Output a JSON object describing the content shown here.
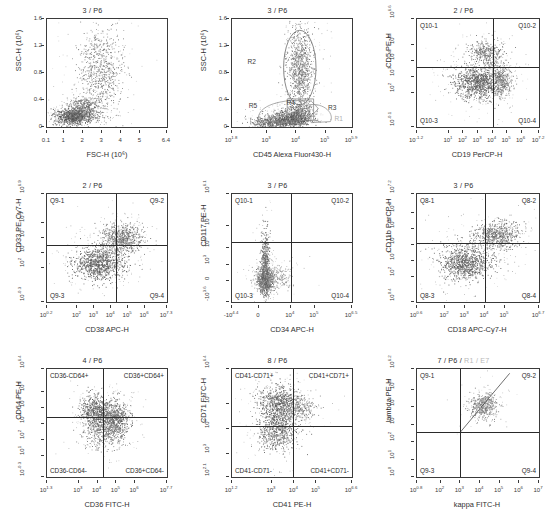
{
  "figure": {
    "kind": "flow-cytometry-panel-grid",
    "rows": 3,
    "cols": 3
  },
  "chart_data": [
    {
      "id": "p1",
      "type": "scatter",
      "title": "3 / P6",
      "xlabel": "FSC-H (10⁶)",
      "ylabel": "SSC-H (10⁶)",
      "xscale": "linear",
      "yscale": "linear",
      "xlim": [
        0.1,
        6.4
      ],
      "ylim": [
        0,
        1.6
      ],
      "xticks": [
        "0.1",
        "1",
        "2",
        "3",
        "4",
        "5",
        "6.4"
      ],
      "xtick_pos": [
        0.0,
        0.143,
        0.302,
        0.46,
        0.619,
        0.778,
        1.0
      ],
      "yticks": [
        "0",
        "0.4",
        "0.8",
        "1.2",
        "1.6"
      ],
      "ytick_pos": [
        0.0,
        0.25,
        0.5,
        0.75,
        1.0
      ],
      "grid": false,
      "quadrants": null,
      "gates": [],
      "clusters": [
        {
          "name": "lymphocytes",
          "cx": 0.22,
          "cy": 0.1,
          "sx": 0.075,
          "sy": 0.035,
          "n": 900,
          "shade": 0.16
        },
        {
          "name": "monocytes",
          "cx": 0.31,
          "cy": 0.18,
          "sx": 0.075,
          "sy": 0.045,
          "n": 380,
          "shade": 0.3
        },
        {
          "name": "granulocytes",
          "cx": 0.44,
          "cy": 0.52,
          "sx": 0.09,
          "sy": 0.2,
          "n": 700,
          "shade": 0.42
        }
      ]
    },
    {
      "id": "p2",
      "type": "scatter",
      "title": "3 / P6",
      "xlabel": "CD45 Alexa Fluor430-H",
      "ylabel": "SSC-H (10⁶)",
      "xscale": "log",
      "yscale": "linear",
      "xlim": [
        "10^1.8",
        "10^5.9"
      ],
      "ylim": [
        0,
        1.6
      ],
      "xticks": [
        "10^1.8",
        "10^3",
        "10^4",
        "10^5",
        "10^5.9"
      ],
      "xtick_pos": [
        0.0,
        0.293,
        0.537,
        0.78,
        1.0
      ],
      "yticks": [
        "0",
        "0.4",
        "0.8",
        "1.2",
        "1.6"
      ],
      "ytick_pos": [
        0.0,
        0.25,
        0.5,
        0.75,
        1.0
      ],
      "grid": false,
      "quadrants": null,
      "gates": [
        {
          "name": "R2",
          "label_x": 0.13,
          "label_y": 0.6,
          "shape": "ellipse",
          "cx": 0.565,
          "cy": 0.55,
          "rx": 0.135,
          "ry": 0.345,
          "faint": false
        },
        {
          "name": "R5",
          "label_x": 0.14,
          "label_y": 0.195,
          "shape": "polygon",
          "faint": false
        },
        {
          "name": "R4",
          "label_x": 0.455,
          "label_y": 0.225,
          "shape": "polygon",
          "faint": false
        },
        {
          "name": "R3",
          "label_x": 0.8,
          "label_y": 0.18,
          "shape": "polygon",
          "faint": false
        },
        {
          "name": "R1",
          "label_x": 0.855,
          "label_y": 0.075,
          "shape": "polygon",
          "faint": true
        }
      ],
      "clusters": [
        {
          "name": "granulocytes",
          "cx": 0.565,
          "cy": 0.56,
          "sx": 0.055,
          "sy": 0.19,
          "n": 820,
          "shade": 0.36
        },
        {
          "name": "monocytes",
          "cx": 0.555,
          "cy": 0.135,
          "sx": 0.06,
          "sy": 0.045,
          "n": 300,
          "shade": 0.3
        },
        {
          "name": "lymphocytes",
          "cx": 0.47,
          "cy": 0.07,
          "sx": 0.085,
          "sy": 0.035,
          "n": 780,
          "shade": 0.18
        },
        {
          "name": "debris",
          "cx": 0.3,
          "cy": 0.045,
          "sx": 0.07,
          "sy": 0.03,
          "n": 280,
          "shade": 0.26
        }
      ]
    },
    {
      "id": "p3",
      "type": "scatter",
      "title": "2 / P6",
      "xlabel": "CD19 PerCP-H",
      "ylabel": "CD5 PE-H",
      "xscale": "log",
      "yscale": "log",
      "xlim": [
        "10^-1.2",
        "10^7.2"
      ],
      "ylim": [
        "10^-0.1",
        "10^6.6"
      ],
      "xticks": [
        "10^-1.2",
        "10^1",
        "10^2",
        "10^3",
        "10^4",
        "10^5",
        "10^6",
        "10^7.2"
      ],
      "xtick_pos": [
        0.0,
        0.262,
        0.381,
        0.5,
        0.619,
        0.738,
        0.857,
        1.0
      ],
      "yticks": [
        "10^-0.1",
        "10^2",
        "10^3",
        "10^4",
        "10^5",
        "10^6.6"
      ],
      "ytick_pos": [
        0.0,
        0.313,
        0.463,
        0.612,
        0.761,
        1.0
      ],
      "grid": false,
      "quadrants": {
        "x": 0.627,
        "y": 0.556,
        "labels": [
          "Q10-1",
          "Q10-2",
          "Q10-3",
          "Q10-4"
        ]
      },
      "gates": [],
      "clusters": [
        {
          "name": "main",
          "cx": 0.5,
          "cy": 0.415,
          "sx": 0.1,
          "sy": 0.075,
          "n": 900,
          "shade": 0.18
        },
        {
          "name": "cd5hi",
          "cx": 0.56,
          "cy": 0.69,
          "sx": 0.075,
          "sy": 0.06,
          "n": 330,
          "shade": 0.3
        },
        {
          "name": "cd19pos",
          "cx": 0.69,
          "cy": 0.43,
          "sx": 0.04,
          "sy": 0.08,
          "n": 260,
          "shade": 0.3
        }
      ]
    },
    {
      "id": "p4",
      "type": "scatter",
      "title": "2 / P6",
      "xlabel": "CD38 APC-H",
      "ylabel": "CD33 PE-Cy7-H",
      "xscale": "log",
      "yscale": "log",
      "xlim": [
        "10^0.2",
        "10^7.3"
      ],
      "ylim": [
        "10^-0.3",
        "10^6.9"
      ],
      "xticks": [
        "10^0.2",
        "10^2",
        "10^3",
        "10^4",
        "10^5",
        "10^6",
        "10^7.3"
      ],
      "xtick_pos": [
        0.0,
        0.254,
        0.394,
        0.535,
        0.676,
        0.817,
        1.0
      ],
      "yticks": [
        "10^-0.3",
        "10^2",
        "10^3",
        "10^4",
        "10^5",
        "10^6.9"
      ],
      "ytick_pos": [
        0.0,
        0.319,
        0.458,
        0.597,
        0.736,
        1.0
      ],
      "grid": false,
      "quadrants": {
        "x": 0.575,
        "y": 0.525,
        "labels": [
          "Q9-1",
          "Q9-2",
          "Q9-3",
          "Q9-4"
        ]
      },
      "gates": [],
      "clusters": [
        {
          "name": "low",
          "cx": 0.43,
          "cy": 0.36,
          "sx": 0.105,
          "sy": 0.075,
          "n": 900,
          "shade": 0.2
        },
        {
          "name": "high",
          "cx": 0.62,
          "cy": 0.585,
          "sx": 0.085,
          "sy": 0.07,
          "n": 620,
          "shade": 0.3
        }
      ]
    },
    {
      "id": "p5",
      "type": "scatter",
      "title": "3 / P6",
      "xlabel": "CD34 APC-H",
      "ylabel": "CD117 PE-H",
      "xscale": "biexponential",
      "yscale": "biexponential",
      "xlim": [
        "-10^4.4",
        "10^6.5"
      ],
      "ylim": [
        "-10^3.6",
        "10^6.1"
      ],
      "xticks": [
        "-10^4.4",
        "0",
        "10^4",
        "10^5",
        "10^6.5"
      ],
      "xtick_pos": [
        0.0,
        0.225,
        0.49,
        0.69,
        1.0
      ],
      "yticks": [
        "-10^3.6",
        "0",
        "10^3",
        "10^4",
        "10^5",
        "10^6.1"
      ],
      "ytick_pos": [
        0.0,
        0.19,
        0.345,
        0.5,
        0.7,
        1.0
      ],
      "grid": false,
      "quadrants": {
        "x": 0.49,
        "y": 0.56,
        "labels": [
          "Q10-1",
          "Q10-2",
          "Q10-3",
          "Q10-4"
        ]
      },
      "gates": [],
      "clusters": [
        {
          "name": "spike",
          "cx": 0.275,
          "cy": 0.33,
          "sx": 0.018,
          "sy": 0.165,
          "n": 520,
          "shade": 0.24
        },
        {
          "name": "base",
          "cx": 0.272,
          "cy": 0.205,
          "sx": 0.038,
          "sy": 0.048,
          "n": 700,
          "shade": 0.26
        },
        {
          "name": "tail",
          "cx": 0.38,
          "cy": 0.23,
          "sx": 0.07,
          "sy": 0.055,
          "n": 180,
          "shade": 0.55
        }
      ]
    },
    {
      "id": "p6",
      "type": "scatter",
      "title": "3 / P6",
      "xlabel": "CD18 APC-Cy7-H",
      "ylabel": "CD11b PerCP-H",
      "xscale": "log",
      "yscale": "log",
      "xlim": [
        "10^0.6",
        "10^6.7"
      ],
      "ylim": [
        "10^0.4",
        "10^7.2"
      ],
      "xticks": [
        "10^0.6",
        "10^2",
        "10^3",
        "10^4",
        "10^5",
        "10^6.7"
      ],
      "xtick_pos": [
        0.0,
        0.23,
        0.394,
        0.557,
        0.721,
        1.0
      ],
      "yticks": [
        "10^0.4",
        "10^2",
        "10^3",
        "10^4",
        "10^5",
        "10^6",
        "10^7.2"
      ],
      "ytick_pos": [
        0.0,
        0.235,
        0.382,
        0.529,
        0.676,
        0.824,
        1.0
      ],
      "grid": false,
      "quadrants": {
        "x": 0.56,
        "y": 0.545,
        "labels": [
          "Q8-1",
          "Q8-2",
          "Q8-3",
          "Q8-4"
        ]
      },
      "gates": [],
      "clusters": [
        {
          "name": "low",
          "cx": 0.4,
          "cy": 0.36,
          "sx": 0.105,
          "sy": 0.08,
          "n": 860,
          "shade": 0.2
        },
        {
          "name": "high",
          "cx": 0.66,
          "cy": 0.62,
          "sx": 0.095,
          "sy": 0.065,
          "n": 620,
          "shade": 0.3
        }
      ]
    },
    {
      "id": "p7",
      "type": "scatter",
      "title": "4 / P6",
      "xlabel": "CD36 FITC-H",
      "ylabel": "CD64 PE-H",
      "xscale": "log",
      "yscale": "log",
      "xlim": [
        "10^1.3",
        "10^7.7"
      ],
      "ylim": [
        "10^-0.3",
        "10^6.4"
      ],
      "xticks": [
        "10^1.3",
        "10^3",
        "10^4",
        "10^5",
        "10^6",
        "10^7.7"
      ],
      "xtick_pos": [
        0.0,
        0.266,
        0.422,
        0.578,
        0.734,
        1.0
      ],
      "yticks": [
        "10^-0.3",
        "10^1",
        "10^2",
        "10^3",
        "10^4",
        "10^5",
        "10^6.4"
      ],
      "ytick_pos": [
        0.0,
        0.194,
        0.343,
        0.493,
        0.642,
        0.791,
        1.0
      ],
      "grid": false,
      "quadrants": {
        "x": 0.468,
        "y": 0.56,
        "labels": [
          "CD36-CD64+",
          "CD36+CD64+",
          "CD36-CD64-",
          "CD36+CD64-"
        ]
      },
      "gates": [],
      "clusters": [
        {
          "name": "cd36neg",
          "cx": 0.4,
          "cy": 0.6,
          "sx": 0.06,
          "sy": 0.075,
          "n": 560,
          "shade": 0.22
        },
        {
          "name": "cd36pos",
          "cx": 0.56,
          "cy": 0.54,
          "sx": 0.06,
          "sy": 0.085,
          "n": 620,
          "shade": 0.22
        },
        {
          "name": "dim",
          "cx": 0.455,
          "cy": 0.41,
          "sx": 0.075,
          "sy": 0.08,
          "n": 300,
          "shade": 0.4
        }
      ]
    },
    {
      "id": "p8",
      "type": "scatter",
      "title": "8 / P6",
      "xlabel": "CD41 PE-H",
      "ylabel": "CD71 FITC-H",
      "xscale": "log",
      "yscale": "log",
      "xlim": [
        "10^1.2",
        "10^6.6"
      ],
      "ylim": [
        "10^2.1",
        "10^6.4"
      ],
      "xticks": [
        "10^1.2",
        "10^3",
        "10^4",
        "10^5",
        "10^6.6"
      ],
      "xtick_pos": [
        0.0,
        0.333,
        0.519,
        0.704,
        1.0
      ],
      "yticks": [
        "10^2.1",
        "10^3",
        "10^4",
        "10^5",
        "10^6.4"
      ],
      "ytick_pos": [
        0.0,
        0.209,
        0.442,
        0.674,
        1.0
      ],
      "grid": false,
      "quadrants": {
        "x": 0.51,
        "y": 0.47,
        "labels": [
          "CD41-CD71+",
          "CD41+CD71+",
          "CD41-CD71-",
          "CD41+CD71-"
        ]
      },
      "gates": [],
      "clusters": [
        {
          "name": "cd71hi",
          "cx": 0.4,
          "cy": 0.665,
          "sx": 0.09,
          "sy": 0.095,
          "n": 760,
          "shade": 0.2
        },
        {
          "name": "cd71lo",
          "cx": 0.375,
          "cy": 0.42,
          "sx": 0.085,
          "sy": 0.085,
          "n": 520,
          "shade": 0.26
        },
        {
          "name": "diag",
          "cx": 0.57,
          "cy": 0.64,
          "sx": 0.07,
          "sy": 0.06,
          "n": 200,
          "shade": 0.45
        }
      ]
    },
    {
      "id": "p9",
      "type": "scatter",
      "title_parts": [
        "7 / P6",
        "R1 / E7"
      ],
      "title": "7 / P6 / R1 / E7",
      "xlabel": "kappa FITC-H",
      "ylabel": "lambda PE-H",
      "xscale": "log",
      "yscale": "log",
      "xlim": [
        "10^0.8",
        "10^7"
      ],
      "ylim": [
        "10^0",
        "10^6.2"
      ],
      "xticks": [
        "10^0.8",
        "10^2",
        "10^3",
        "10^4",
        "10^5",
        "10^6",
        "10^7"
      ],
      "xtick_pos": [
        0.0,
        0.194,
        0.355,
        0.516,
        0.677,
        0.839,
        1.0
      ],
      "yticks": [
        "10^0",
        "10^1",
        "10^2",
        "10^3",
        "10^4",
        "10^5",
        "10^6.2"
      ],
      "ytick_pos": [
        0.0,
        0.161,
        0.323,
        0.484,
        0.645,
        0.806,
        1.0
      ],
      "grid": false,
      "quadrants": {
        "x": 0.355,
        "y": 0.415,
        "labels": [
          "Q9-1",
          "Q9-2",
          "Q9-3",
          "Q9-4"
        ]
      },
      "gates": [
        {
          "name": "diagonal-line",
          "x1": 0.355,
          "y1": 0.415,
          "x2": 0.76,
          "y2": 0.96,
          "faint": false
        }
      ],
      "clusters": [
        {
          "name": "kappa-lambda-cluster",
          "cx": 0.54,
          "cy": 0.665,
          "sx": 0.055,
          "sy": 0.06,
          "n": 420,
          "shade": 0.4
        }
      ]
    }
  ]
}
